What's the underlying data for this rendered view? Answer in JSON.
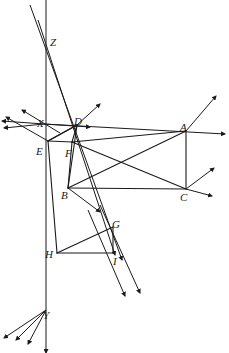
{
  "diagram": {
    "type": "line-diagram",
    "width": 229,
    "height": 353,
    "background_color": "#ffffff",
    "stroke_color": "#1a1a1a",
    "stroke_width": 1.0,
    "label_style": "italic-serif",
    "vanishing_points": [
      {
        "name": "X",
        "x": 44,
        "y": 124,
        "label_x": 37,
        "label_y": 118
      },
      {
        "name": "Y",
        "x": 46,
        "y": 310,
        "label_x": 43,
        "label_y": 310
      },
      {
        "name": "Z",
        "x": 46,
        "y": 47,
        "label_x": 50,
        "label_y": 37
      }
    ],
    "points": [
      {
        "name": "A",
        "x": 186,
        "y": 131,
        "label_x": 180,
        "label_y": 122
      },
      {
        "name": "B",
        "x": 68,
        "y": 188,
        "label_x": 61,
        "label_y": 190
      },
      {
        "name": "C",
        "x": 186,
        "y": 189,
        "label_x": 180,
        "label_y": 192
      },
      {
        "name": "D",
        "x": 77,
        "y": 125,
        "label_x": 74,
        "label_y": 116
      },
      {
        "name": "E",
        "x": 48,
        "y": 141,
        "label_x": 36,
        "label_y": 146
      },
      {
        "name": "F",
        "x": 72,
        "y": 142,
        "label_x": 65,
        "label_y": 148
      },
      {
        "name": "G",
        "x": 113,
        "y": 227,
        "label_x": 112,
        "label_y": 219
      },
      {
        "name": "H",
        "x": 57,
        "y": 253,
        "label_x": 45,
        "label_y": 249
      },
      {
        "name": "I",
        "x": 113,
        "y": 253,
        "label_x": 113,
        "label_y": 256
      }
    ],
    "labels": [
      {
        "text": "A"
      },
      {
        "text": "B"
      },
      {
        "text": "C"
      },
      {
        "text": "D"
      },
      {
        "text": "E"
      },
      {
        "text": "F"
      },
      {
        "text": "G"
      },
      {
        "text": "H"
      },
      {
        "text": "I"
      },
      {
        "text": "X"
      },
      {
        "text": "Y"
      },
      {
        "text": "Z"
      }
    ],
    "solid_edges": [
      {
        "name": "edge-E-D",
        "from": [
          48,
          141
        ],
        "to": [
          77,
          125
        ]
      },
      {
        "name": "edge-E-F",
        "from": [
          48,
          141
        ],
        "to": [
          72,
          142
        ]
      },
      {
        "name": "edge-D-F",
        "from": [
          77,
          125
        ],
        "to": [
          72,
          142
        ]
      },
      {
        "name": "edge-E-D-diag",
        "from": [
          48,
          141
        ],
        "to": [
          77,
          125
        ]
      },
      {
        "name": "edge-F-A",
        "from": [
          72,
          142
        ],
        "to": [
          186,
          131
        ]
      },
      {
        "name": "edge-A-C",
        "from": [
          186,
          131
        ],
        "to": [
          186,
          189
        ]
      },
      {
        "name": "edge-B-C",
        "from": [
          68,
          188
        ],
        "to": [
          186,
          189
        ]
      },
      {
        "name": "edge-F-B",
        "from": [
          72,
          142
        ],
        "to": [
          68,
          188
        ]
      },
      {
        "name": "edge-F-C-diag",
        "from": [
          72,
          142
        ],
        "to": [
          186,
          189
        ]
      },
      {
        "name": "edge-B-A-diag",
        "from": [
          68,
          188
        ],
        "to": [
          186,
          131
        ]
      },
      {
        "name": "edge-H-I",
        "from": [
          57,
          253
        ],
        "to": [
          113,
          253
        ]
      },
      {
        "name": "edge-H-G",
        "from": [
          57,
          253
        ],
        "to": [
          113,
          227
        ]
      },
      {
        "name": "edge-G-I",
        "from": [
          113,
          227
        ],
        "to": [
          113,
          253
        ]
      },
      {
        "name": "edge-E-H-vertical",
        "from": [
          48,
          141
        ],
        "to": [
          57,
          253
        ]
      },
      {
        "name": "edge-D-B",
        "from": [
          77,
          125
        ],
        "to": [
          68,
          188
        ]
      }
    ],
    "rays": [
      {
        "name": "ray-X-to-A",
        "from": [
          44,
          124
        ],
        "to": [
          225,
          134
        ]
      },
      {
        "name": "ray-X-to-D",
        "from": [
          44,
          124
        ],
        "to": [
          90,
          127
        ]
      },
      {
        "name": "ray-X-left-1",
        "from": [
          44,
          124
        ],
        "to": [
          2,
          121
        ]
      },
      {
        "name": "ray-X-left-2",
        "from": [
          44,
          124
        ],
        "to": [
          4,
          128
        ]
      },
      {
        "name": "ray-X-upleft-1",
        "from": [
          48,
          141
        ],
        "to": [
          6,
          117
        ]
      },
      {
        "name": "ray-X-upleft-2",
        "from": [
          60,
          133
        ],
        "to": [
          22,
          110
        ]
      },
      {
        "name": "ray-Z-down-1",
        "from": [
          30,
          5
        ],
        "to": [
          122,
          260
        ]
      },
      {
        "name": "ray-Z-down-2",
        "from": [
          46,
          0
        ],
        "to": [
          46,
          353
        ]
      },
      {
        "name": "ray-Z-down-3",
        "from": [
          38,
          20
        ],
        "to": [
          115,
          255
        ]
      },
      {
        "name": "ray-Y-downleft-1",
        "from": [
          46,
          310
        ],
        "to": [
          4,
          338
        ]
      },
      {
        "name": "ray-Y-downleft-2",
        "from": [
          46,
          310
        ],
        "to": [
          16,
          340
        ]
      },
      {
        "name": "ray-Y-downleft-3",
        "from": [
          46,
          310
        ],
        "to": [
          28,
          344
        ]
      },
      {
        "name": "ray-C-upright",
        "from": [
          186,
          189
        ],
        "to": [
          214,
          168
        ]
      },
      {
        "name": "ray-C-right",
        "from": [
          186,
          189
        ],
        "to": [
          212,
          196
        ]
      },
      {
        "name": "ray-A-upright",
        "from": [
          186,
          131
        ],
        "to": [
          216,
          96
        ]
      },
      {
        "name": "ray-D-upright",
        "from": [
          77,
          125
        ],
        "to": [
          100,
          104
        ]
      },
      {
        "name": "ray-B-downright",
        "from": [
          68,
          188
        ],
        "to": [
          100,
          212
        ]
      },
      {
        "name": "ray-down-1",
        "from": [
          88,
          210
        ],
        "to": [
          125,
          296
        ]
      },
      {
        "name": "ray-down-2",
        "from": [
          100,
          205
        ],
        "to": [
          140,
          293
        ]
      }
    ],
    "annotations": {
      "description": "Perspective grid with three vanishing points X, Y and Z; nine construction points A through I forming a box in three-point perspective."
    }
  }
}
